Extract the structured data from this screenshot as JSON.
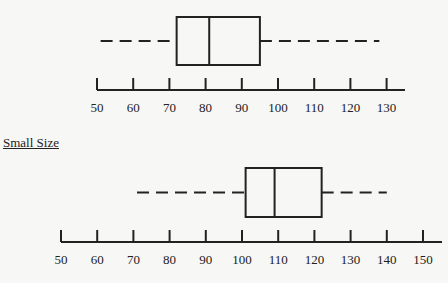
{
  "chart_data": [
    {
      "type": "boxplot",
      "title": "",
      "section_label": "",
      "orientation": "horizontal",
      "whisker_low": 51,
      "q1": 72,
      "median": 81,
      "q3": 95,
      "whisker_high": 128,
      "axis": {
        "min": 50,
        "max": 130,
        "step": 10,
        "tick_labels": [
          "50",
          "60",
          "70",
          "80",
          "90",
          "100",
          "110",
          "120",
          "130"
        ]
      },
      "grid": false
    },
    {
      "type": "boxplot",
      "title": "",
      "section_label": "Small Size",
      "orientation": "horizontal",
      "whisker_low": 71,
      "q1": 101,
      "median": 109,
      "q3": 122,
      "whisker_high": 140,
      "axis": {
        "min": 50,
        "max": 150,
        "step": 10,
        "tick_labels": [
          "50",
          "60",
          "70",
          "80",
          "90",
          "100",
          "110",
          "120",
          "130",
          "140",
          "150"
        ]
      },
      "grid": false
    }
  ],
  "labels": {
    "small_size": "Small Size"
  },
  "colors": {
    "line": "#222222",
    "background": "#f7f7f5"
  }
}
